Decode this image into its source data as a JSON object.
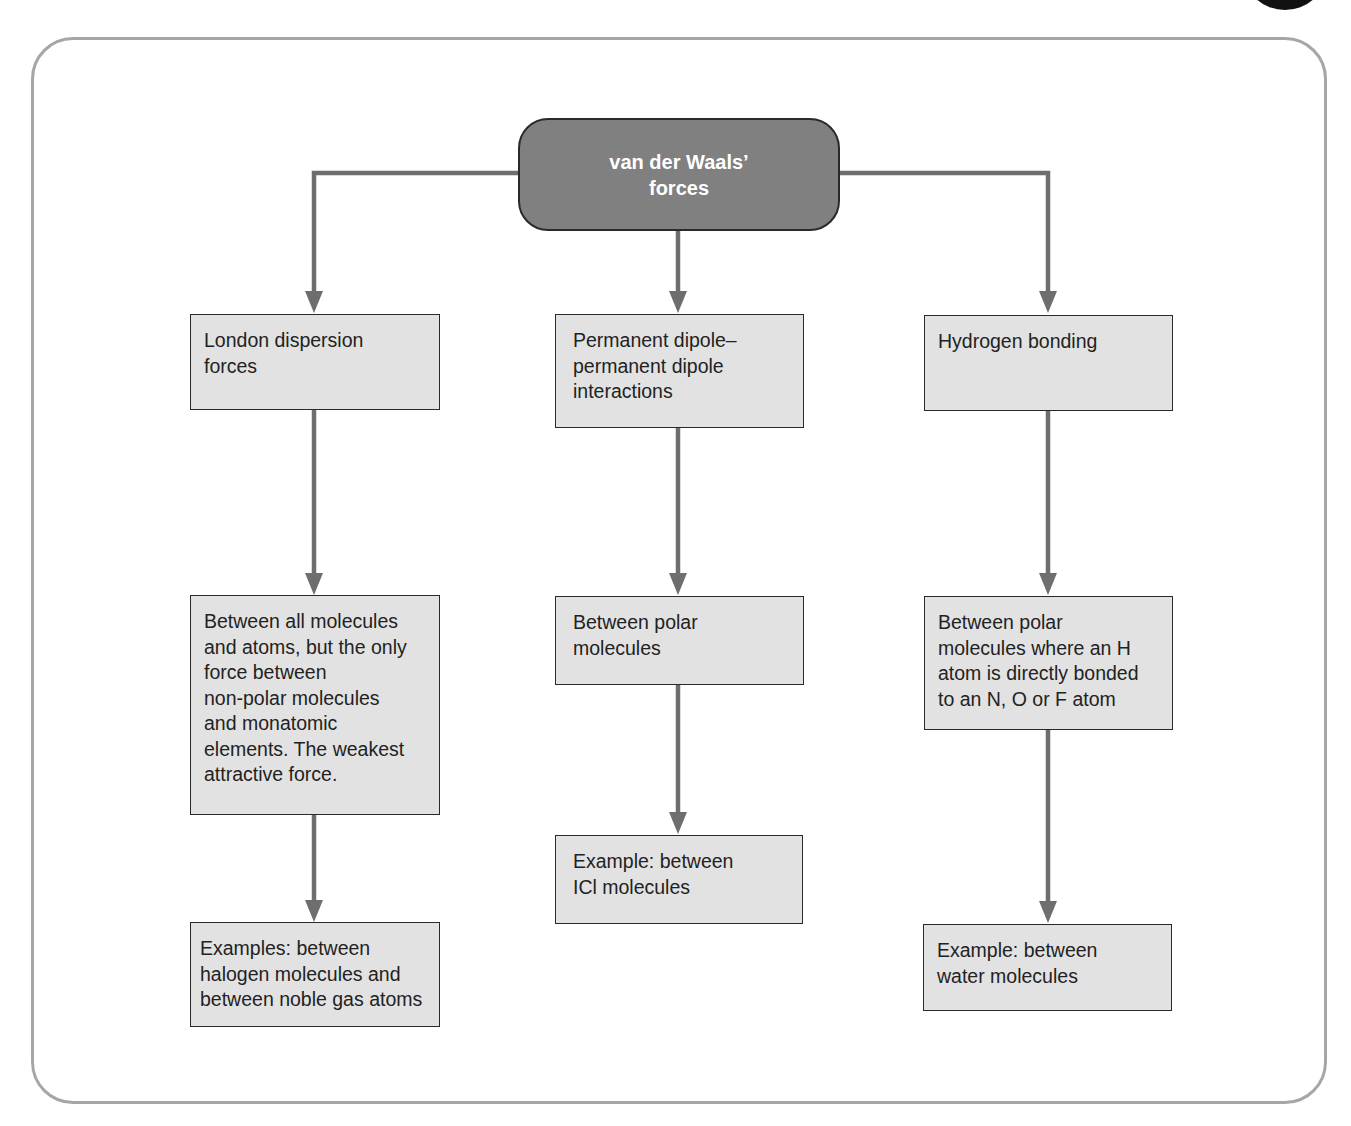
{
  "diagram": {
    "type": "flowchart",
    "colors": {
      "frame_border": "#a6a6a6",
      "root_fill": "#808080",
      "node_fill": "#e2e2e2",
      "node_border": "#2a2a2a",
      "arrow": "#6e6e6e"
    },
    "root": {
      "label": "van der Waals’\nforces"
    },
    "columns": [
      {
        "name": "london",
        "title": "London dispersion\nforces",
        "description": "Between all molecules\nand atoms, but the only\nforce between\nnon-polar molecules\nand monatomic\nelements. The weakest\nattractive force.",
        "example": "Examples: between\nhalogen molecules and\nbetween noble gas atoms"
      },
      {
        "name": "dipole",
        "title": "Permanent dipole–\npermanent dipole\ninteractions",
        "description": "Between polar\nmolecules",
        "example": "Example: between\nICl molecules"
      },
      {
        "name": "hydrogen",
        "title": "Hydrogen bonding",
        "description": "Between polar\nmolecules where an H\natom is directly bonded\nto an N, O or F atom",
        "example": "Example: between\nwater molecules"
      }
    ],
    "edges": [
      [
        "van der Waals’ forces",
        "London dispersion forces"
      ],
      [
        "van der Waals’ forces",
        "Permanent dipole–permanent dipole interactions"
      ],
      [
        "van der Waals’ forces",
        "Hydrogen bonding"
      ],
      [
        "London dispersion forces",
        "Between all molecules and atoms..."
      ],
      [
        "Between all molecules and atoms...",
        "Examples: between halogen molecules and between noble gas atoms"
      ],
      [
        "Permanent dipole–permanent dipole interactions",
        "Between polar molecules"
      ],
      [
        "Between polar molecules",
        "Example: between ICl molecules"
      ],
      [
        "Hydrogen bonding",
        "Between polar molecules where an H atom is directly bonded to an N, O or F atom"
      ],
      [
        "Between polar molecules where an H atom...",
        "Example: between water molecules"
      ]
    ]
  }
}
